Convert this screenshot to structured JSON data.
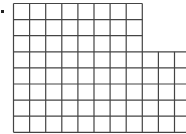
{
  "figure": {
    "bullet": true,
    "top_block": {
      "rows": 3,
      "cols": 8
    },
    "bottom_block": {
      "rows": 5,
      "cols": 11
    },
    "line_color": "#444444",
    "background": "#ffffff"
  }
}
